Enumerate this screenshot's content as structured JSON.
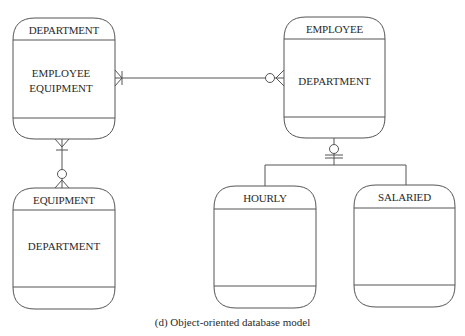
{
  "diagram": {
    "caption": "(d) Object-oriented database model",
    "colors": {
      "stroke": "#555555",
      "text": "#2a2a2a",
      "background": "#ffffff"
    },
    "entities": [
      {
        "id": "department",
        "title": "DEPARTMENT",
        "attributes": [
          "EMPLOYEE",
          "EQUIPMENT"
        ]
      },
      {
        "id": "employee",
        "title": "EMPLOYEE",
        "attributes": [
          "DEPARTMENT"
        ]
      },
      {
        "id": "equipment",
        "title": "EQUIPMENT",
        "attributes": [
          "DEPARTMENT"
        ]
      },
      {
        "id": "hourly",
        "title": "HOURLY",
        "attributes": []
      },
      {
        "id": "salaried",
        "title": "SALARIED",
        "attributes": []
      }
    ],
    "relationships": [
      {
        "from": "DEPARTMENT",
        "to": "EMPLOYEE",
        "from_end": "one-and-only-one/many",
        "to_end": "zero-or-many"
      },
      {
        "from": "DEPARTMENT",
        "to": "EQUIPMENT",
        "from_end": "one-or-many",
        "to_end": "zero-or-many"
      },
      {
        "from": "EMPLOYEE",
        "to": [
          "HOURLY",
          "SALARIED"
        ],
        "type": "generalization",
        "from_end": "zero-or-one"
      }
    ]
  }
}
